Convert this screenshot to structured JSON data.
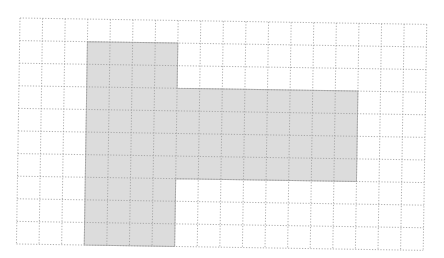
{
  "diagram": {
    "type": "grid-shape",
    "grid": {
      "columns": 18,
      "rows": 10,
      "cell_size_px": 22.6,
      "origin_px": [
        20,
        18
      ],
      "rotation_deg": 0.9,
      "line_color": "#9a9a9a",
      "line_style": "dotted"
    },
    "shape": {
      "fill_color": "#dcdcdc",
      "border_color": "#b8b8b8",
      "parts": [
        {
          "name": "vertical-bar",
          "col": 3,
          "row": 1,
          "width": 4,
          "height": 9
        },
        {
          "name": "horizontal-bar",
          "col": 7,
          "row": 3,
          "width": 8,
          "height": 4
        }
      ],
      "outline_cells": [
        [
          3,
          1
        ],
        [
          7,
          1
        ],
        [
          7,
          3
        ],
        [
          15,
          3
        ],
        [
          15,
          7
        ],
        [
          7,
          7
        ],
        [
          7,
          10
        ],
        [
          3,
          10
        ]
      ]
    }
  }
}
